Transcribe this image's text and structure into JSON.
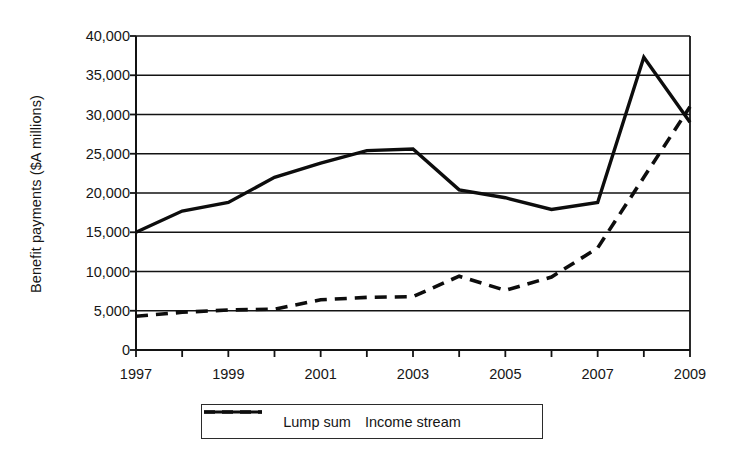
{
  "chart_data": {
    "type": "line",
    "title": "",
    "subtitle": "",
    "xlabel": "",
    "ylabel": "Benefit payments ($A millions)",
    "x": [
      1997,
      1998,
      1999,
      2000,
      2001,
      2002,
      2003,
      2004,
      2005,
      2006,
      2007,
      2008,
      2009
    ],
    "xtick_labels": [
      "1997",
      "1999",
      "2001",
      "2003",
      "2005",
      "2007",
      "2009"
    ],
    "xtick_values": [
      1997,
      1999,
      2001,
      2003,
      2005,
      2007,
      2009
    ],
    "xlim": [
      1997,
      2009
    ],
    "ylim": [
      0,
      40000
    ],
    "ytick_labels": [
      "0",
      "5,000",
      "10,000",
      "15,000",
      "20,000",
      "25,000",
      "30,000",
      "35,000",
      "40,000"
    ],
    "ytick_values": [
      0,
      5000,
      10000,
      15000,
      20000,
      25000,
      30000,
      35000,
      40000
    ],
    "grid": "horizontal",
    "legend_position": "below-axis",
    "series": [
      {
        "name": "Lump sum",
        "style": "solid",
        "color": "#0d0d0d",
        "values": [
          15000,
          17700,
          18800,
          22000,
          23800,
          25400,
          25600,
          20400,
          19400,
          17900,
          18800,
          37300,
          29000
        ]
      },
      {
        "name": "Income stream",
        "style": "dashed",
        "color": "#0d0d0d",
        "values": [
          4300,
          4800,
          5100,
          5200,
          6400,
          6700,
          6800,
          9400,
          7600,
          9300,
          13000,
          22000,
          31000
        ]
      }
    ]
  },
  "legend": {
    "entries": [
      {
        "label": "Lump sum",
        "style": "solid"
      },
      {
        "label": "Income stream",
        "style": "dashed"
      }
    ]
  }
}
